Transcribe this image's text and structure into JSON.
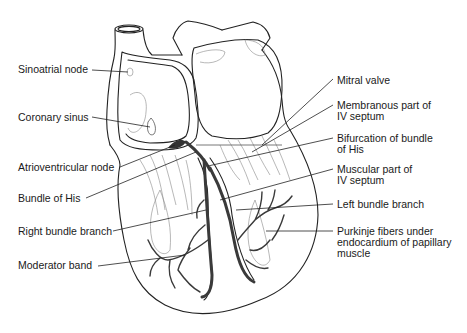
{
  "figure": {
    "labels_left": [
      {
        "id": "sinoatrial-node",
        "text": "Sinoatrial node"
      },
      {
        "id": "coronary-sinus",
        "text": "Coronary sinus"
      },
      {
        "id": "atrioventricular-node",
        "text": "Atrioventricular node"
      },
      {
        "id": "bundle-of-his",
        "text": "Bundle of His"
      },
      {
        "id": "right-bundle-branch",
        "text": "Right bundle branch"
      },
      {
        "id": "moderator-band",
        "text": "Moderator band"
      }
    ],
    "labels_right": [
      {
        "id": "mitral-valve",
        "text": "Mitral valve"
      },
      {
        "id": "membranous-iv-septum",
        "text": "Membranous part of\nIV septum"
      },
      {
        "id": "bifurcation-bundle-his",
        "text": "Bifurcation of bundle\nof His"
      },
      {
        "id": "muscular-iv-septum",
        "text": "Muscular part of\nIV septum"
      },
      {
        "id": "left-bundle-branch",
        "text": "Left bundle branch"
      },
      {
        "id": "purkinje-fibers",
        "text": "Purkinje fibers under\nendocardium of papillary\nmuscle"
      }
    ]
  }
}
